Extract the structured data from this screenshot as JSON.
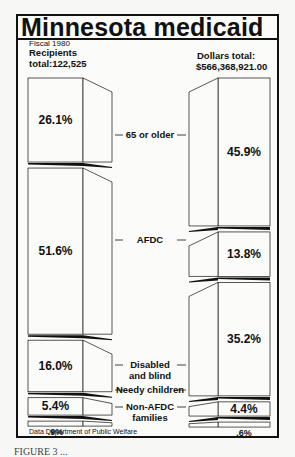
{
  "title": "Minnesota medicaid",
  "fiscal_year": "Fiscal 1980",
  "left_header": {
    "line1": "Recipients",
    "line2": "total:122,525"
  },
  "right_header": {
    "line1": "Dollars total:",
    "line2": "$566,368,921.00"
  },
  "source": "Data Department of Public Welfare",
  "caption": "FIGURE 3 ...",
  "colors": {
    "ink": "#111111",
    "paper": "#fbfbf9",
    "shadow": "#111111"
  },
  "chart_data": {
    "type": "bar",
    "title": "Minnesota medicaid",
    "subtitle": "Fiscal 1980",
    "categories": [
      "65 or older",
      "AFDC",
      "Disabled and blind",
      "Needy children",
      "Non-AFDC families"
    ],
    "series": [
      {
        "name": "Recipients (total: 122,525)",
        "values": [
          26.1,
          51.6,
          16.0,
          5.4,
          0.9
        ],
        "labels": [
          "26.1%",
          "51.6%",
          "16.0%",
          "5.4%",
          ".9%"
        ]
      },
      {
        "name": "Dollars (total: $566,368,921.00)",
        "values": [
          45.9,
          13.8,
          35.2,
          4.4,
          0.6
        ],
        "labels": [
          "45.9%",
          "13.8%",
          "35.2%",
          "4.4%",
          ".6%"
        ]
      }
    ],
    "xlabel": "",
    "ylabel": "Percent of total",
    "layout": "two stacked 3D columns facing each other with category labels in the center",
    "source": "Data Department of Public Welfare"
  }
}
